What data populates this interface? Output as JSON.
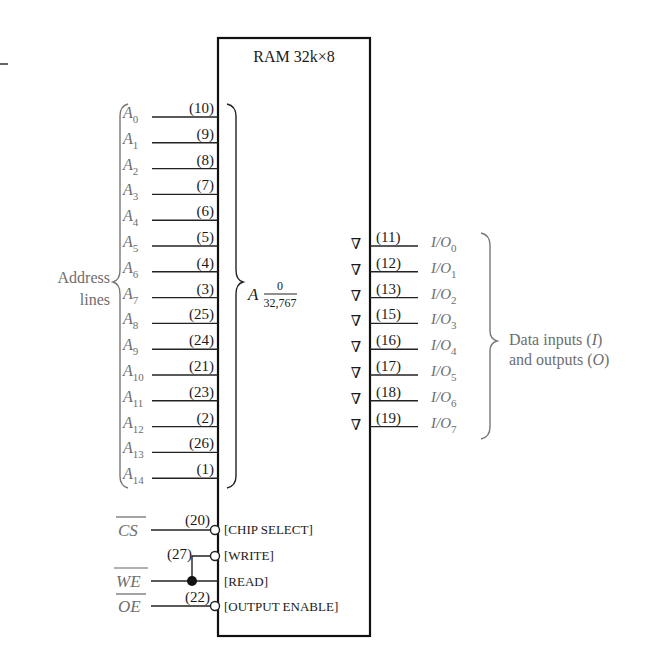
{
  "chip": {
    "title": "RAM 32k×8",
    "address_range_label": "A",
    "address_range_top": "0",
    "address_range_bottom": "32,767"
  },
  "address_group": {
    "label_line1": "Address",
    "label_line2": "lines",
    "lines": [
      {
        "name": "A",
        "sub": "0",
        "pin": "(10)"
      },
      {
        "name": "A",
        "sub": "1",
        "pin": "(9)"
      },
      {
        "name": "A",
        "sub": "2",
        "pin": "(8)"
      },
      {
        "name": "A",
        "sub": "3",
        "pin": "(7)"
      },
      {
        "name": "A",
        "sub": "4",
        "pin": "(6)"
      },
      {
        "name": "A",
        "sub": "5",
        "pin": "(5)"
      },
      {
        "name": "A",
        "sub": "6",
        "pin": "(4)"
      },
      {
        "name": "A",
        "sub": "7",
        "pin": "(3)"
      },
      {
        "name": "A",
        "sub": "8",
        "pin": "(25)"
      },
      {
        "name": "A",
        "sub": "9",
        "pin": "(24)"
      },
      {
        "name": "A",
        "sub": "10",
        "pin": "(21)"
      },
      {
        "name": "A",
        "sub": "11",
        "pin": "(23)"
      },
      {
        "name": "A",
        "sub": "12",
        "pin": "(2)"
      },
      {
        "name": "A",
        "sub": "13",
        "pin": "(26)"
      },
      {
        "name": "A",
        "sub": "14",
        "pin": "(1)"
      }
    ]
  },
  "data_group": {
    "label_line1": "Data inputs (",
    "label_line1_italic": "I",
    "label_line1_end": ")",
    "label_line2": "and outputs (",
    "label_line2_italic": "O",
    "label_line2_end": ")",
    "tristate_symbol": "∇",
    "lines": [
      {
        "name": "I/O",
        "sub": "0",
        "pin": "(11)"
      },
      {
        "name": "I/O",
        "sub": "1",
        "pin": "(12)"
      },
      {
        "name": "I/O",
        "sub": "2",
        "pin": "(13)"
      },
      {
        "name": "I/O",
        "sub": "3",
        "pin": "(15)"
      },
      {
        "name": "I/O",
        "sub": "4",
        "pin": "(16)"
      },
      {
        "name": "I/O",
        "sub": "5",
        "pin": "(17)"
      },
      {
        "name": "I/O",
        "sub": "6",
        "pin": "(18)"
      },
      {
        "name": "I/O",
        "sub": "7",
        "pin": "(19)"
      }
    ]
  },
  "control": {
    "cs": {
      "signal": "CS",
      "pin": "(20)",
      "function": "[CHIP SELECT]"
    },
    "write": {
      "pin": "(27)",
      "function": "[WRITE]"
    },
    "we": {
      "signal": "WE",
      "function": "[READ]"
    },
    "oe": {
      "signal": "OE",
      "pin": "(22)",
      "function": "[OUTPUT ENABLE]"
    }
  }
}
